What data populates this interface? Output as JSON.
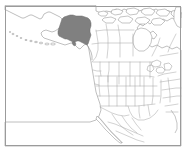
{
  "figure": {
    "kind": "map",
    "width": 186,
    "height": 152,
    "background_color": "#ffffff",
    "frame": {
      "visible": true,
      "color": "#9b9b9b",
      "inset_left": 5,
      "inset_top": 6,
      "inset_right": 181,
      "inset_bottom": 146
    },
    "colors": {
      "background": "#ffffff",
      "coastline": "#8a8a8a",
      "admin_boundary": "#9a9a9a",
      "highlight_fill": "#808080",
      "highlight_stroke": "#6e6e6e",
      "frame": "#9b9b9b"
    },
    "highlight": {
      "region_name": "Alaska",
      "fill_color": "#808080",
      "is_filled": true
    },
    "regions": [
      {
        "name": "Alaska",
        "highlighted": true
      },
      {
        "name": "Canada",
        "highlighted": false
      },
      {
        "name": "Contiguous United States",
        "highlighted": false
      },
      {
        "name": "Mexico",
        "highlighted": false
      },
      {
        "name": "Aleutian Islands",
        "highlighted": false
      },
      {
        "name": "Canadian Arctic Archipelago",
        "highlighted": false
      },
      {
        "name": "Baja California",
        "highlighted": false
      },
      {
        "name": "Greenland",
        "highlighted": false
      }
    ],
    "features": {
      "state_boundaries": true,
      "province_boundaries": true,
      "coastlines": true,
      "graticule": false,
      "labels": false,
      "legend": false
    }
  }
}
